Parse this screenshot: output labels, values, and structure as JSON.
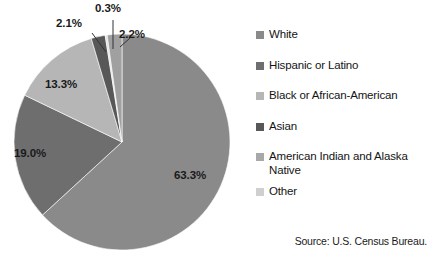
{
  "chart_data": {
    "type": "pie",
    "title": "",
    "subtitle": "",
    "xlabel": "",
    "ylabel": "",
    "legend_position": "right",
    "grid": false,
    "categories": [
      "White",
      "Hispanic or Latino",
      "Black or African-American",
      "Asian",
      "American Indian and Alaska Native",
      "Other"
    ],
    "values": [
      63.3,
      19.0,
      13.3,
      2.1,
      0.3,
      2.2
    ],
    "value_labels": [
      "63.3%",
      "19.0%",
      "13.3%",
      "2.1%",
      "0.3%",
      "2.2%"
    ],
    "colors": [
      "#8a8a8a",
      "#6e6e6e",
      "#b6b6b6",
      "#585858",
      "#e2e2e2",
      "#a0a0a0"
    ],
    "units": "percent",
    "start_angle_deg": 0,
    "direction": "clockwise",
    "source": "Source: U.S. Census Bureau."
  },
  "legend": {
    "items": [
      {
        "label": "White",
        "color": "#8a8a8a"
      },
      {
        "label": "Hispanic or Latino",
        "color": "#6e6e6e"
      },
      {
        "label": "Black or African-American",
        "color": "#b6b6b6"
      },
      {
        "label": "Asian",
        "color": "#585858"
      },
      {
        "label": "American Indian and Alaska Native",
        "color": "#a8a8a8"
      },
      {
        "label": "Other",
        "color": "#cfcfcf"
      }
    ]
  },
  "labels": {
    "inside": [
      {
        "text": "63.3%",
        "left": 174,
        "top": 169
      },
      {
        "text": "19.0%",
        "left": 14,
        "top": 147
      },
      {
        "text": "13.3%",
        "left": 45,
        "top": 78
      }
    ],
    "callouts": [
      {
        "text": "2.1%",
        "left": 56,
        "top": 17
      },
      {
        "text": "0.3%",
        "left": 95,
        "top": 2
      },
      {
        "text": "2.2%",
        "left": 119,
        "top": 28
      }
    ]
  },
  "source_note": "Source: U.S. Census Bureau."
}
